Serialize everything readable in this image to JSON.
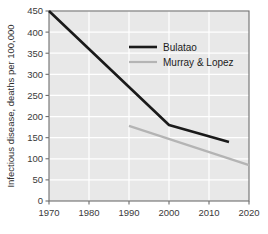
{
  "chart_data": {
    "type": "line",
    "title": "",
    "xlabel": "",
    "ylabel": "Infectious disease, deaths per 100,000",
    "xlim": [
      1970,
      2020
    ],
    "ylim": [
      0,
      450
    ],
    "xticks": [
      1970,
      1980,
      1990,
      2000,
      2010,
      2020
    ],
    "yticks": [
      0,
      50,
      100,
      150,
      200,
      250,
      300,
      350,
      400,
      450
    ],
    "xtick_labels": [
      "1970",
      "1980",
      "1990",
      "2000",
      "2010",
      "2020"
    ],
    "ytick_labels": [
      "0",
      "50",
      "100",
      "150",
      "200",
      "250",
      "300",
      "350",
      "400",
      "450"
    ],
    "grid": true,
    "grid_color": "#ffffff",
    "plot_background": "#e8e8e8",
    "legend_position": "upper-center",
    "series": [
      {
        "name": "Bulatao",
        "color": "#1a1a1a",
        "line_width": 2.6,
        "x": [
          1970,
          2000,
          2015
        ],
        "values": [
          450,
          180,
          140
        ]
      },
      {
        "name": "Murray & Lopez",
        "color": "#b4b4b4",
        "line_width": 2.2,
        "x": [
          1990,
          2020
        ],
        "values": [
          178,
          85
        ]
      }
    ]
  },
  "legend": {
    "entries": [
      {
        "label": "Bulatao"
      },
      {
        "label": "Murray & Lopez"
      }
    ]
  }
}
